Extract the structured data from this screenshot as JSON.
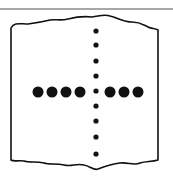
{
  "figure": {
    "colors": {
      "ink": "#111111",
      "rule": "#888888",
      "background": "#ffffff"
    },
    "horizontal_large_dots": {
      "count": 7,
      "y": 92,
      "x": [
        38,
        52,
        66,
        80,
        110,
        124,
        138
      ],
      "radius": 5.5
    },
    "vertical_small_dots": {
      "count": 9,
      "x": 96,
      "y": [
        31,
        45,
        61,
        76,
        91,
        106,
        121,
        137,
        154
      ],
      "radius": 2.6
    }
  }
}
